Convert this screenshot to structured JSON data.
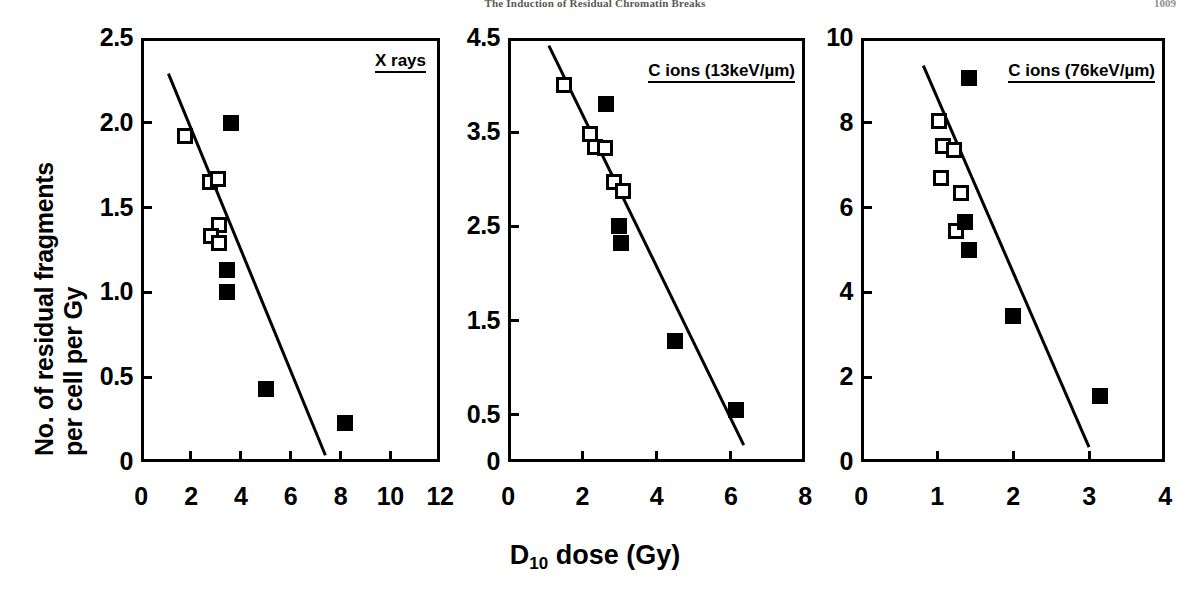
{
  "header": {
    "running_head": "The Induction of Residual Chromatin Breaks",
    "page_number": "1009"
  },
  "axes_labels": {
    "y_line1": "No. of residual fragments",
    "y_line2": "per cell per Gy",
    "x_label_prefix": "D",
    "x_label_sub": "10",
    "x_label_suffix": " dose (Gy)"
  },
  "panels": [
    {
      "id": "x-rays",
      "title": "X rays",
      "x_ticks": [
        "0",
        "2",
        "4",
        "6",
        "8",
        "10",
        "12"
      ],
      "y_ticks": [
        "0",
        "0.5",
        "1.0",
        "1.5",
        "2.0",
        "2.5"
      ]
    },
    {
      "id": "c-ions-13",
      "title": "C ions (13keV/µm)",
      "x_ticks": [
        "0",
        "2",
        "4",
        "6",
        "8"
      ],
      "y_ticks": [
        "0",
        "0.5",
        "1.5",
        "2.5",
        "3.5",
        "4.5"
      ]
    },
    {
      "id": "c-ions-76",
      "title": "C ions (76keV/µm)",
      "x_ticks": [
        "0",
        "1",
        "2",
        "3",
        "4"
      ],
      "y_ticks": [
        "0",
        "2",
        "4",
        "6",
        "8",
        "10"
      ]
    }
  ],
  "chart_data": [
    {
      "type": "scatter",
      "title": "X rays",
      "xlabel": "D10 dose (Gy)",
      "ylabel": "No. of residual fragments per cell per Gy",
      "xlim": [
        0,
        12
      ],
      "ylim": [
        0,
        2.5
      ],
      "xticks": [
        0,
        2,
        4,
        6,
        8,
        10,
        12
      ],
      "yticks": [
        0,
        0.5,
        1.0,
        1.5,
        2.0,
        2.5
      ],
      "grid": false,
      "legend": "none",
      "series": [
        {
          "name": "open squares",
          "marker": "open-square",
          "points": [
            {
              "x": 1.75,
              "y": 1.92
            },
            {
              "x": 2.75,
              "y": 1.65
            },
            {
              "x": 3.1,
              "y": 1.67
            },
            {
              "x": 3.15,
              "y": 1.4
            },
            {
              "x": 2.8,
              "y": 1.33
            },
            {
              "x": 3.15,
              "y": 1.29
            }
          ]
        },
        {
          "name": "filled squares",
          "marker": "filled-square",
          "points": [
            {
              "x": 3.6,
              "y": 2.0
            },
            {
              "x": 3.45,
              "y": 1.13
            },
            {
              "x": 3.45,
              "y": 1.0
            },
            {
              "x": 5.0,
              "y": 0.43
            },
            {
              "x": 8.2,
              "y": 0.23
            }
          ]
        }
      ],
      "fit_line": {
        "x1": 1.1,
        "y1": 2.29,
        "x2": 7.4,
        "y2": 0.04
      }
    },
    {
      "type": "scatter",
      "title": "C ions (13keV/µm)",
      "xlabel": "D10 dose (Gy)",
      "ylabel": "No. of residual fragments per cell per Gy",
      "xlim": [
        0,
        8
      ],
      "ylim": [
        0,
        4.5
      ],
      "xticks": [
        0,
        2,
        4,
        6,
        8
      ],
      "yticks": [
        0,
        0.5,
        1.5,
        2.5,
        3.5,
        4.5
      ],
      "grid": false,
      "legend": "none",
      "series": [
        {
          "name": "open squares",
          "marker": "open-square",
          "points": [
            {
              "x": 1.5,
              "y": 4.0
            },
            {
              "x": 2.2,
              "y": 3.48
            },
            {
              "x": 2.35,
              "y": 3.34
            },
            {
              "x": 2.6,
              "y": 3.33
            },
            {
              "x": 2.85,
              "y": 2.97
            },
            {
              "x": 3.1,
              "y": 2.88
            }
          ]
        },
        {
          "name": "filled squares",
          "marker": "filled-square",
          "points": [
            {
              "x": 2.65,
              "y": 3.8
            },
            {
              "x": 3.0,
              "y": 2.5
            },
            {
              "x": 3.05,
              "y": 2.32
            },
            {
              "x": 4.5,
              "y": 1.28
            },
            {
              "x": 6.15,
              "y": 0.55
            }
          ]
        }
      ],
      "fit_line": {
        "x1": 1.1,
        "y1": 4.42,
        "x2": 6.35,
        "y2": 0.18
      }
    },
    {
      "type": "scatter",
      "title": "C ions (76keV/µm)",
      "xlabel": "D10 dose (Gy)",
      "ylabel": "No. of residual fragments per cell per Gy",
      "xlim": [
        0,
        4
      ],
      "ylim": [
        0,
        10
      ],
      "xticks": [
        0,
        1,
        2,
        3,
        4
      ],
      "yticks": [
        0,
        2,
        4,
        6,
        8,
        10
      ],
      "grid": false,
      "legend": "none",
      "series": [
        {
          "name": "open squares",
          "marker": "open-square",
          "points": [
            {
              "x": 1.03,
              "y": 8.05
            },
            {
              "x": 1.08,
              "y": 7.45
            },
            {
              "x": 1.22,
              "y": 7.35
            },
            {
              "x": 1.05,
              "y": 6.7
            },
            {
              "x": 1.32,
              "y": 6.35
            },
            {
              "x": 1.25,
              "y": 5.45
            }
          ]
        },
        {
          "name": "filled squares",
          "marker": "filled-square",
          "points": [
            {
              "x": 1.42,
              "y": 9.05
            },
            {
              "x": 1.37,
              "y": 5.65
            },
            {
              "x": 1.42,
              "y": 5.0
            },
            {
              "x": 2.0,
              "y": 3.45
            },
            {
              "x": 3.15,
              "y": 1.55
            }
          ]
        }
      ],
      "fit_line": {
        "x1": 0.82,
        "y1": 9.35,
        "x2": 3.0,
        "y2": 0.35
      }
    }
  ]
}
